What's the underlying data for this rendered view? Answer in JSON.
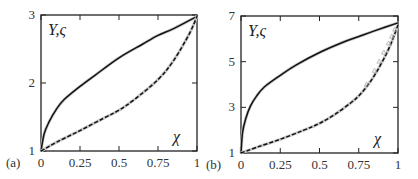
{
  "chart_data": [
    {
      "type": "line",
      "panel_label": "(a)",
      "title": "",
      "xlabel": "χ",
      "ylabel": "Y, ς",
      "xlim": [
        0,
        1
      ],
      "ylim": [
        1,
        3
      ],
      "xticks": [
        "0",
        "0.25",
        "0.5",
        "0.75",
        "1"
      ],
      "yticks": [
        "1",
        "2",
        "3"
      ],
      "grid": false,
      "series": [
        {
          "name": "Y",
          "style": "solid",
          "x": [
            0,
            0.02,
            0.05,
            0.1,
            0.15,
            0.25,
            0.35,
            0.5,
            0.65,
            0.75,
            0.85,
            1
          ],
          "y": [
            1.0,
            1.25,
            1.42,
            1.62,
            1.76,
            1.95,
            2.12,
            2.37,
            2.57,
            2.7,
            2.8,
            2.98
          ]
        },
        {
          "name": "ς",
          "style": "dashed",
          "x": [
            0,
            0.1,
            0.25,
            0.4,
            0.5,
            0.6,
            0.75,
            0.85,
            0.95,
            1
          ],
          "y": [
            1.0,
            1.13,
            1.3,
            1.48,
            1.6,
            1.76,
            2.05,
            2.33,
            2.72,
            2.98
          ]
        }
      ]
    },
    {
      "type": "line",
      "panel_label": "(b)",
      "title": "",
      "xlabel": "χ",
      "ylabel": "Y, ς",
      "xlim": [
        0,
        1
      ],
      "ylim": [
        1,
        7
      ],
      "xticks": [
        "0",
        "0.25",
        "0.5",
        "0.75",
        "1"
      ],
      "yticks": [
        "1",
        "3",
        "5",
        "7"
      ],
      "grid": false,
      "series": [
        {
          "name": "Y",
          "style": "solid",
          "x": [
            0,
            0.01,
            0.03,
            0.06,
            0.1,
            0.15,
            0.25,
            0.35,
            0.5,
            0.65,
            0.75,
            0.85,
            1
          ],
          "y": [
            1.0,
            1.9,
            2.5,
            3.05,
            3.5,
            3.9,
            4.4,
            4.85,
            5.4,
            5.85,
            6.1,
            6.35,
            6.7
          ]
        },
        {
          "name": "ς",
          "style": "dashed",
          "x": [
            0,
            0.1,
            0.25,
            0.4,
            0.5,
            0.6,
            0.7,
            0.75,
            0.8,
            0.85,
            0.9,
            0.95,
            1
          ],
          "y": [
            1.0,
            1.25,
            1.6,
            2.0,
            2.3,
            2.7,
            3.2,
            3.5,
            3.9,
            4.4,
            5.0,
            5.7,
            6.6
          ]
        },
        {
          "name": "reference (gray markers)",
          "style": "markers",
          "x": [
            0.8,
            0.85,
            0.88,
            0.91,
            0.94,
            0.96,
            0.98
          ],
          "y": [
            4.0,
            4.6,
            5.0,
            5.4,
            5.8,
            6.1,
            6.4
          ]
        }
      ]
    }
  ]
}
